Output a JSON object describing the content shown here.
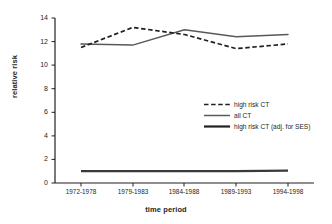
{
  "chart_data": {
    "type": "line",
    "title": "",
    "xlabel": "time period",
    "ylabel": "relative risk",
    "categories": [
      "1972-1978",
      "1979-1983",
      "1984-1988",
      "1989-1993",
      "1994-1998"
    ],
    "ylim": [
      0,
      14
    ],
    "yticks": [
      0,
      2,
      4,
      6,
      8,
      10,
      12,
      14
    ],
    "grid": false,
    "legend_position": "center-right",
    "series": [
      {
        "name": "high risk CT",
        "style": "dashed",
        "color": "#231f20",
        "values": [
          11.5,
          13.2,
          12.6,
          11.4,
          11.8
        ]
      },
      {
        "name": "all CT",
        "style": "solid-thin",
        "color": "#58595b",
        "values": [
          11.8,
          11.7,
          13.0,
          12.4,
          12.6
        ]
      },
      {
        "name": "high risk CT (adj. for SES)",
        "style": "solid-thick",
        "color": "#231f20",
        "values": [
          1.0,
          1.0,
          1.0,
          1.0,
          1.05
        ]
      }
    ]
  },
  "axis": {
    "y_tick_labels": [
      "0",
      "2",
      "4",
      "6",
      "8",
      "10",
      "12",
      "14"
    ],
    "y_title": "relative risk",
    "x_title": "time period"
  },
  "legend": {
    "entries": [
      {
        "label": "high risk CT",
        "key": "dashed-line-key"
      },
      {
        "label": "all CT",
        "key": "thin-line-key"
      },
      {
        "label": "high risk CT (adj. for SES)",
        "key": "thick-line-key"
      }
    ]
  }
}
